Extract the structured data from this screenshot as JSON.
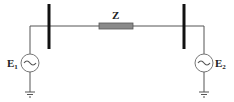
{
  "diagram": {
    "type": "two-bus power system single-line diagram",
    "impedance": {
      "label": "Z",
      "color": "#8a8a8a"
    },
    "sources": [
      {
        "label": "E",
        "subscript": "1",
        "symbol": "~"
      },
      {
        "label": "E",
        "subscript": "2",
        "symbol": "~"
      }
    ],
    "buses": [
      "left-bus",
      "right-bus"
    ],
    "colors": {
      "line": "#555555",
      "bus": "#111111",
      "impedance_fill": "#8a8a8a"
    }
  }
}
